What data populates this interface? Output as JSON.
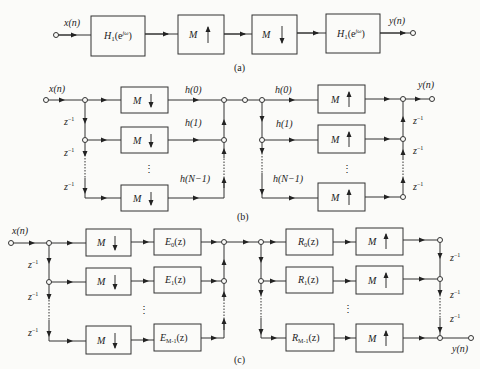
{
  "figure": {
    "a": {
      "caption": "(a)",
      "input": "x(n)",
      "output": "y(n)",
      "blocks": [
        "H₁(e^jω)",
        "M ↑",
        "M ↓",
        "H₁(e^jω)"
      ]
    },
    "b": {
      "caption": "(b)",
      "input": "x(n)",
      "output": "y(n)",
      "delay": "z⁻¹",
      "decimator": "M ↓",
      "interpolator": "M ↑",
      "coeffs_left": [
        "h(0)",
        "h(1)",
        "h(N−1)"
      ],
      "coeffs_right": [
        "h(0)",
        "h(1)",
        "h(N−1)"
      ],
      "ellipsis": "⋮"
    },
    "c": {
      "caption": "(c)",
      "input": "x(n)",
      "output": "y(n)",
      "delay": "z⁻¹",
      "decimator": "M ↓",
      "interpolator": "M ↑",
      "E": [
        "E₀(z)",
        "E₁(z)",
        "E_M−1(z)"
      ],
      "R": [
        "R₀(z)",
        "R₁(z)",
        "R_M−1(z)"
      ],
      "ellipsis": "⋮"
    }
  },
  "labels": {
    "M": "M",
    "z": "z",
    "zexp": "−1",
    "a_in": "x(n)",
    "a_out": "y(n)",
    "a_H1": "H",
    "a_H1_sub": "1",
    "a_H1_arg": "(e",
    "a_H1_sup": "jω",
    "a_H1_close": ")",
    "b_in": "x(n)",
    "b_out": "y(n)",
    "h0": "h(0)",
    "h1": "h(1)",
    "hN": "h(N−1)",
    "c_in": "x(n)",
    "c_out": "y(n)",
    "E": "E",
    "R": "R",
    "s0": "0",
    "s1": "1",
    "sM": "M-1",
    "arg": "(z)",
    "vdots": "⋮",
    "cap_a": "(a)",
    "cap_b": "(b)",
    "cap_c": "(c)"
  }
}
